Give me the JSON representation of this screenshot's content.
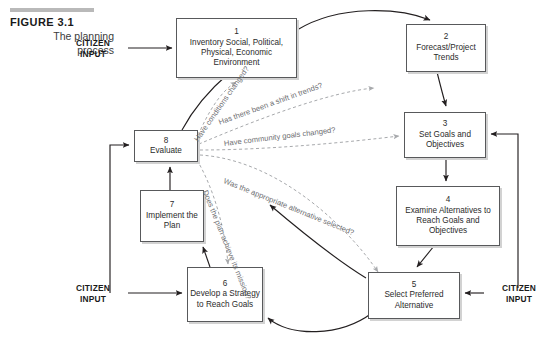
{
  "figure": {
    "number_label": "FIGURE 3.1",
    "subtitle_line1": "The planning",
    "subtitle_line2": "process"
  },
  "citizen_inputs": [
    {
      "id": "top",
      "line1": "CITIZEN",
      "line2": "INPUT"
    },
    {
      "id": "bottom-left",
      "line1": "CITIZEN",
      "line2": "INPUT"
    },
    {
      "id": "bottom-right",
      "line1": "CITIZEN",
      "line2": "INPUT"
    }
  ],
  "boxes": [
    {
      "num": "1",
      "label": "Inventory Social, Political, Physical, Economic Environment"
    },
    {
      "num": "2",
      "label": "Forecast/Project Trends"
    },
    {
      "num": "3",
      "label": "Set Goals and Objectives"
    },
    {
      "num": "4",
      "label": "Examine Alternatives to Reach Goals and Objectives"
    },
    {
      "num": "5",
      "label": "Select Preferred Alternative"
    },
    {
      "num": "6",
      "label": "Develop a Strategy to Reach Goals"
    },
    {
      "num": "7",
      "label": "Implement the Plan"
    },
    {
      "num": "8",
      "label": "Evaluate"
    }
  ],
  "questions": [
    {
      "id": "q1",
      "text": "Have conditions changed?"
    },
    {
      "id": "q2",
      "text": "Has there been a shift in trends?"
    },
    {
      "id": "q3",
      "text": "Have community goals changed?"
    },
    {
      "id": "q4",
      "text": "Was the appropriate alternative selected?"
    },
    {
      "id": "q5",
      "text": "Does the plan achieve its mission?"
    }
  ],
  "colors": {
    "box_border": "#58595b",
    "box_shadow": "#d2d2d2",
    "solid_arrow": "#231f20",
    "dashed_arrow": "#a7a9ac",
    "caption_rule": "#b9b9b9",
    "background": "#ffffff"
  }
}
